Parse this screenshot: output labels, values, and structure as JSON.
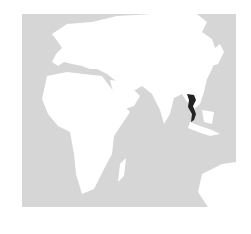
{
  "map": {
    "type": "locator-map",
    "region_shown": "Europe, Africa, Asia, Indian Ocean, Australia (partial)",
    "highlighted_country": "Vietnam",
    "colors": {
      "ocean": "#d6d6d6",
      "land": "#ffffff",
      "highlight": "#222222",
      "background": "#ffffff"
    }
  }
}
